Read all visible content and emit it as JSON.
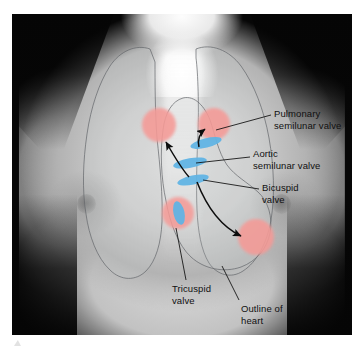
{
  "figure": {
    "type": "anatomical-overlay-diagram",
    "colors": {
      "valve_marker": "#5fb4e5",
      "auscultation_point": "#f59a96",
      "leader_line": "#0d0d0d",
      "arrow": "#0d0d0d",
      "organ_outline": "#6d6f72",
      "label_text": "#101010",
      "plate_border": "#ffffff",
      "plate_background": "#050505"
    }
  },
  "labels": [
    {
      "id": "pulmonary",
      "name": "pulmonary-semilunar-valve",
      "text": "Pulmonary\nsemilunar valve",
      "line1": "Pulmonary",
      "line2": "semilunar valve"
    },
    {
      "id": "aortic",
      "name": "aortic-semilunar-valve",
      "text": "Aortic\nsemilunar valve",
      "line1": "Aortic",
      "line2": "semilunar valve"
    },
    {
      "id": "bicuspid",
      "name": "bicuspid-valve",
      "text": "Bicuspid\nvalve",
      "line1": "Bicuspid",
      "line2": "valve"
    },
    {
      "id": "tricuspid",
      "name": "tricuspid-valve",
      "text": "Tricuspid\nvalve",
      "line1": "Tricuspid",
      "line2": "valve"
    },
    {
      "id": "outline",
      "name": "outline-of-heart",
      "text": "Outline of\nheart",
      "line1": "Outline of",
      "line2": "heart"
    }
  ],
  "valve_markers": [
    {
      "name": "pulmonary-valve-marker",
      "cx": 206,
      "cy": 143,
      "rx": 16,
      "ry": 4.6,
      "rotate": -14
    },
    {
      "name": "aortic-valve-marker",
      "cx": 190,
      "cy": 163,
      "rx": 17,
      "ry": 4.8,
      "rotate": -10
    },
    {
      "name": "bicuspid-valve-marker",
      "cx": 193,
      "cy": 180,
      "rx": 16,
      "ry": 4.6,
      "rotate": -12
    },
    {
      "name": "tricuspid-valve-marker",
      "cx": 179,
      "cy": 213,
      "rx": 5.5,
      "ry": 12,
      "rotate": -12
    }
  ],
  "auscultation_points": [
    {
      "name": "aortic-auscultation-point",
      "cx": 159,
      "cy": 125,
      "r": 17
    },
    {
      "name": "pulmonary-auscultation-point",
      "cx": 214,
      "cy": 124,
      "r": 16
    },
    {
      "name": "tricuspid-auscultation-point",
      "cx": 178,
      "cy": 213,
      "r": 16
    },
    {
      "name": "bicuspid-auscultation-point",
      "cx": 256,
      "cy": 237,
      "r": 18
    }
  ],
  "arrows": [
    {
      "name": "aortic-projection-arrow",
      "from": [
        188,
        176
      ],
      "to": [
        164,
        140
      ]
    },
    {
      "name": "pulmonary-projection-arrow",
      "from": [
        200,
        146
      ],
      "to": [
        206,
        128
      ]
    },
    {
      "name": "bicuspid-projection-arrow",
      "from": [
        196,
        182
      ],
      "to": [
        243,
        236
      ]
    }
  ],
  "organ_outlines": [
    {
      "name": "right-lung-outline"
    },
    {
      "name": "left-lung-outline"
    },
    {
      "name": "heart-outline"
    }
  ]
}
